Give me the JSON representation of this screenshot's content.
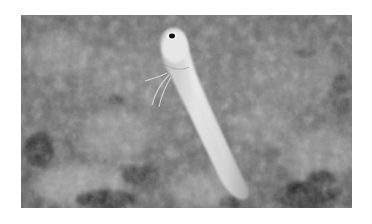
{
  "photo": {
    "subject": "jawfish emerging from burrow in seabed",
    "tone": "grayscale",
    "colors": {
      "page_background": "#ffffff",
      "seabed_mid": "#6e6e6e",
      "seabed_light": "#9a9a9a",
      "seabed_dark": "#2a2a2a",
      "fish_body": "#d6d6d6",
      "fish_highlight": "#ececec",
      "eye": "#111111"
    }
  }
}
